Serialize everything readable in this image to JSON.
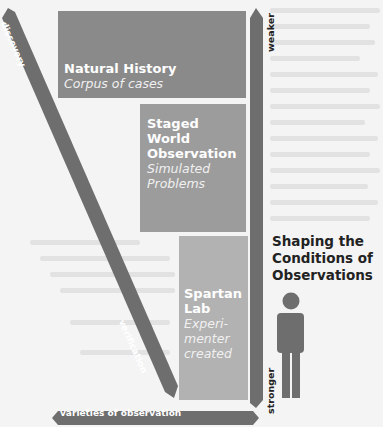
{
  "diagram": {
    "boxes": [
      {
        "title": "Natural History",
        "subtitle": "Corpus of cases",
        "color": "#8a8a8a"
      },
      {
        "title_lines": [
          "Staged",
          "World",
          "Observation"
        ],
        "subtitle_lines": [
          "Simulated",
          "Problems"
        ],
        "color": "#9c9c9c"
      },
      {
        "title_lines": [
          "Spartan",
          "Lab"
        ],
        "subtitle_lines": [
          "Experi-",
          "menter",
          "created"
        ],
        "color": "#b2b2b2"
      }
    ],
    "arrows": {
      "diagonal": {
        "start_label": "discovery",
        "end_label": "verification",
        "color": "#6e6e6e"
      },
      "horizontal": {
        "label": "varieties of observation",
        "color": "#6e6e6e"
      },
      "vertical": {
        "top_label": "weaker",
        "bottom_label": "stronger",
        "color": "#6e6e6e"
      }
    },
    "side_title_lines": [
      "Shaping the",
      "Conditions of",
      "Observations"
    ],
    "figure_icon": "person-icon"
  }
}
